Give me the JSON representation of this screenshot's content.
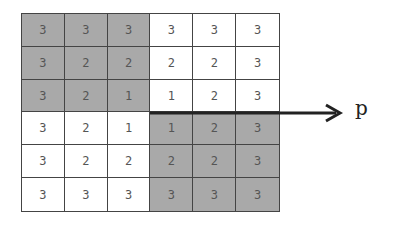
{
  "diagram": {
    "rows": 6,
    "cols": 6,
    "values": [
      [
        "3",
        "3",
        "3",
        "3",
        "3",
        "3"
      ],
      [
        "3",
        "2",
        "2",
        "2",
        "2",
        "3"
      ],
      [
        "3",
        "2",
        "1",
        "1",
        "2",
        "3"
      ],
      [
        "3",
        "2",
        "1",
        "1",
        "2",
        "3"
      ],
      [
        "3",
        "2",
        "2",
        "2",
        "2",
        "3"
      ],
      [
        "3",
        "3",
        "3",
        "3",
        "3",
        "3"
      ]
    ],
    "shaded": [
      [
        true,
        true,
        true,
        false,
        false,
        false
      ],
      [
        true,
        true,
        true,
        false,
        false,
        false
      ],
      [
        true,
        true,
        true,
        false,
        false,
        false
      ],
      [
        false,
        false,
        false,
        true,
        true,
        true
      ],
      [
        false,
        false,
        false,
        true,
        true,
        true
      ],
      [
        false,
        false,
        false,
        true,
        true,
        true
      ]
    ],
    "arrow_label": "p",
    "colors": {
      "shaded": "#a9a9a9",
      "plain": "#ffffff",
      "grid_line": "#444444",
      "arrow": "#222222"
    }
  }
}
